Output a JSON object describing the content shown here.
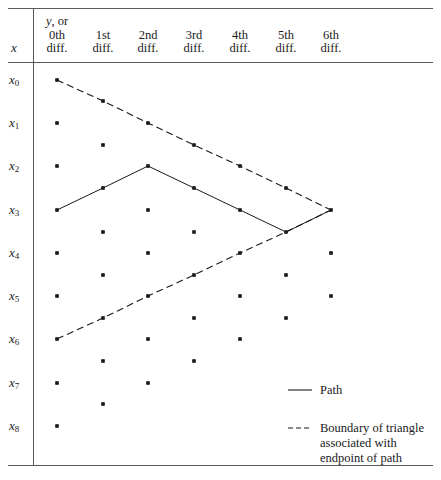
{
  "figure": {
    "title": "",
    "axis_label_x": "x",
    "row_labels": [
      "x0",
      "x1",
      "x2",
      "x3",
      "x4",
      "x5",
      "x6",
      "x7",
      "x8"
    ],
    "row_labels_display": [
      {
        "base": "x",
        "sub": "0"
      },
      {
        "base": "x",
        "sub": "1"
      },
      {
        "base": "x",
        "sub": "2"
      },
      {
        "base": "x",
        "sub": "3"
      },
      {
        "base": "x",
        "sub": "4"
      },
      {
        "base": "x",
        "sub": "5"
      },
      {
        "base": "x",
        "sub": "6"
      },
      {
        "base": "x",
        "sub": "7"
      },
      {
        "base": "x",
        "sub": "8"
      }
    ],
    "columns": [
      {
        "line1": "y, or",
        "line2": "0th",
        "line3": "diff."
      },
      {
        "line1": "",
        "line2": "1st",
        "line3": "diff."
      },
      {
        "line1": "",
        "line2": "2nd",
        "line3": "diff."
      },
      {
        "line1": "",
        "line2": "3rd",
        "line3": "diff."
      },
      {
        "line1": "",
        "line2": "4th",
        "line3": "diff."
      },
      {
        "line1": "",
        "line2": "5th",
        "line3": "diff."
      },
      {
        "line1": "",
        "line2": "6th",
        "line3": "diff."
      }
    ],
    "legend": [
      {
        "style": "solid",
        "label": "Path"
      },
      {
        "style": "dashed",
        "label_line1": "Boundary of triangle",
        "label_line2": "associated with",
        "label_line3": "endpoint of path"
      }
    ],
    "colors": {
      "ink": "#1a1a1a",
      "rule": "#555a5e",
      "background": "#ffffff"
    }
  },
  "chart_data": {
    "type": "scatter",
    "xlabel": "x",
    "ylabel": "",
    "grid": false,
    "legend_position": "bottom-right",
    "column_centers_px": [
      57,
      103,
      148,
      194,
      240,
      286,
      331
    ],
    "row_centers_px": [
      80,
      123,
      166,
      210,
      253,
      296,
      339,
      383,
      426
    ],
    "lattice_points": [
      {
        "col": 0,
        "row": 0,
        "x": 57,
        "y": 80
      },
      {
        "col": 1,
        "row": 0.5,
        "x": 103,
        "y": 101
      },
      {
        "col": 0,
        "row": 1,
        "x": 57,
        "y": 123
      },
      {
        "col": 2,
        "row": 1,
        "x": 148,
        "y": 123
      },
      {
        "col": 1,
        "row": 1.5,
        "x": 103,
        "y": 145
      },
      {
        "col": 3,
        "row": 1.5,
        "x": 194,
        "y": 145
      },
      {
        "col": 0,
        "row": 2,
        "x": 57,
        "y": 166
      },
      {
        "col": 2,
        "row": 2,
        "x": 148,
        "y": 166
      },
      {
        "col": 4,
        "row": 2,
        "x": 240,
        "y": 166
      },
      {
        "col": 1,
        "row": 2.5,
        "x": 103,
        "y": 188
      },
      {
        "col": 3,
        "row": 2.5,
        "x": 194,
        "y": 188
      },
      {
        "col": 5,
        "row": 2.5,
        "x": 286,
        "y": 188
      },
      {
        "col": 0,
        "row": 3,
        "x": 57,
        "y": 210
      },
      {
        "col": 2,
        "row": 3,
        "x": 148,
        "y": 210
      },
      {
        "col": 4,
        "row": 3,
        "x": 240,
        "y": 210
      },
      {
        "col": 6,
        "row": 3,
        "x": 331,
        "y": 210
      },
      {
        "col": 1,
        "row": 3.5,
        "x": 103,
        "y": 232
      },
      {
        "col": 3,
        "row": 3.5,
        "x": 194,
        "y": 232
      },
      {
        "col": 5,
        "row": 3.5,
        "x": 286,
        "y": 232
      },
      {
        "col": 0,
        "row": 4,
        "x": 57,
        "y": 253
      },
      {
        "col": 2,
        "row": 4,
        "x": 148,
        "y": 253
      },
      {
        "col": 4,
        "row": 4,
        "x": 240,
        "y": 253
      },
      {
        "col": 6,
        "row": 4,
        "x": 331,
        "y": 253
      },
      {
        "col": 1,
        "row": 4.5,
        "x": 103,
        "y": 275
      },
      {
        "col": 3,
        "row": 4.5,
        "x": 194,
        "y": 275
      },
      {
        "col": 5,
        "row": 4.5,
        "x": 286,
        "y": 275
      },
      {
        "col": 0,
        "row": 5,
        "x": 57,
        "y": 296
      },
      {
        "col": 2,
        "row": 5,
        "x": 148,
        "y": 296
      },
      {
        "col": 4,
        "row": 5,
        "x": 240,
        "y": 296
      },
      {
        "col": 6,
        "row": 5,
        "x": 331,
        "y": 296
      },
      {
        "col": 1,
        "row": 5.5,
        "x": 103,
        "y": 318
      },
      {
        "col": 3,
        "row": 5.5,
        "x": 194,
        "y": 318
      },
      {
        "col": 5,
        "row": 5.5,
        "x": 286,
        "y": 318
      },
      {
        "col": 0,
        "row": 6,
        "x": 57,
        "y": 339
      },
      {
        "col": 2,
        "row": 6,
        "x": 148,
        "y": 339
      },
      {
        "col": 4,
        "row": 6,
        "x": 240,
        "y": 339
      },
      {
        "col": 1,
        "row": 6.5,
        "x": 103,
        "y": 361
      },
      {
        "col": 3,
        "row": 6.5,
        "x": 194,
        "y": 361
      },
      {
        "col": 0,
        "row": 7,
        "x": 57,
        "y": 383
      },
      {
        "col": 2,
        "row": 7,
        "x": 148,
        "y": 383
      },
      {
        "col": 1,
        "row": 7.5,
        "x": 103,
        "y": 404
      },
      {
        "col": 0,
        "row": 8,
        "x": 57,
        "y": 426
      }
    ],
    "path_solid": {
      "label": "Path",
      "points": [
        {
          "x": 57,
          "y": 210
        },
        {
          "x": 103,
          "y": 188
        },
        {
          "x": 148,
          "y": 166
        },
        {
          "x": 194,
          "y": 188
        },
        {
          "x": 240,
          "y": 210
        },
        {
          "x": 286,
          "y": 232
        },
        {
          "x": 331,
          "y": 210
        }
      ]
    },
    "boundary_dashed": {
      "label": "Boundary of triangle associated with endpoint of path",
      "upper_edge": [
        {
          "x": 57,
          "y": 80
        },
        {
          "x": 103,
          "y": 101
        },
        {
          "x": 148,
          "y": 123
        },
        {
          "x": 194,
          "y": 145
        },
        {
          "x": 240,
          "y": 166
        },
        {
          "x": 286,
          "y": 188
        },
        {
          "x": 331,
          "y": 210
        }
      ],
      "lower_edge": [
        {
          "x": 57,
          "y": 339
        },
        {
          "x": 103,
          "y": 318
        },
        {
          "x": 148,
          "y": 296
        },
        {
          "x": 194,
          "y": 275
        },
        {
          "x": 240,
          "y": 253
        },
        {
          "x": 286,
          "y": 232
        },
        {
          "x": 331,
          "y": 210
        }
      ]
    },
    "rules": {
      "top_y": 8,
      "header_bottom_y": 62,
      "bottom_y": 465,
      "vertical_divider_x": 33,
      "left_x": 8,
      "right_x": 433
    }
  }
}
